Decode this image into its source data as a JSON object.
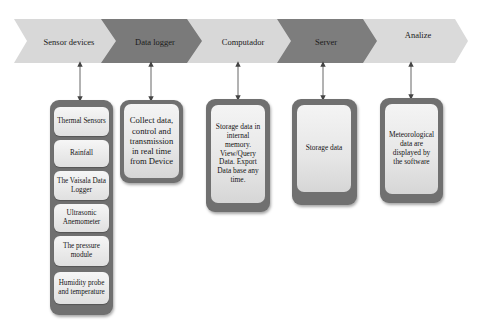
{
  "diagram": {
    "type": "process-flow",
    "stages": [
      {
        "id": "sensor-devices",
        "label": "Sensor devices",
        "shade": "light"
      },
      {
        "id": "data-logger",
        "label": "Data logger",
        "shade": "dark"
      },
      {
        "id": "computador",
        "label": "Computador",
        "shade": "light"
      },
      {
        "id": "server",
        "label": "Server",
        "shade": "dark"
      },
      {
        "id": "analize",
        "label": "Analize",
        "shade": "light"
      }
    ],
    "details": {
      "sensor_devices": {
        "items": [
          "Thermal Sensors",
          "Rainfall",
          "The Vaisala Data Logger",
          "Ultrasonic Anemometer",
          "The pressure module",
          "Humidity probe and temperature"
        ]
      },
      "data_logger": "Collect data, control and transmission in real time from Device",
      "computador": "Storage data in internal memory. View/Query Data. Export Data base any time.",
      "server": "Storage data",
      "analize": "Meteorological data are displayed by the software"
    },
    "colors": {
      "chevron_light": "#d9d9d9",
      "chevron_dark": "#7a7a7a",
      "box_border": "#707070",
      "box_fill": "#e8e8e8",
      "arrow": "#555555"
    }
  }
}
